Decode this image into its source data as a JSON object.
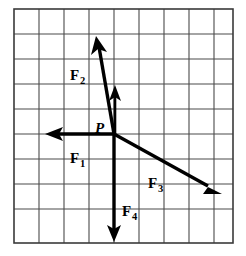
{
  "figure": {
    "background_color": "#ffffff",
    "grid": {
      "columns": 8,
      "rows": 9,
      "cell_size_px": 25,
      "left_px": 14,
      "top_px": 9,
      "line_color": "#4a4a4a",
      "border_color": "#3a3a3a"
    },
    "origin": {
      "label": "P",
      "grid_col": 4,
      "grid_row": 5,
      "x_px": 114,
      "y_px": 134,
      "label_x_px": 95,
      "label_y_px": 133
    },
    "vectors": [
      {
        "name": "F1",
        "label_base": "F",
        "label_sub": "1",
        "direction": "left",
        "length_units": 2.7,
        "tip_x_px": 46,
        "tip_y_px": 134,
        "label_x_px": 70,
        "label_y_px": 163,
        "color": "#000000"
      },
      {
        "name": "F2",
        "label_base": "F",
        "label_sub": "2",
        "direction": "up-left",
        "length_units": 4.0,
        "tip_x_px": 96,
        "tip_y_px": 38,
        "label_x_px": 70,
        "label_y_px": 80,
        "color": "#000000"
      },
      {
        "name": "F3",
        "label_base": "F",
        "label_sub": "3",
        "direction": "down-right",
        "length_units": 4.5,
        "tip_x_px": 221,
        "tip_y_px": 194,
        "label_x_px": 148,
        "label_y_px": 188,
        "color": "#000000"
      },
      {
        "name": "F4",
        "label_base": "F",
        "label_sub": "4",
        "direction": "down",
        "length_units": 4.2,
        "tip_x_px": 114,
        "tip_y_px": 241,
        "label_x_px": 122,
        "label_y_px": 216,
        "color": "#000000"
      },
      {
        "name": "F5-unlabeled",
        "label_base": "",
        "label_sub": "",
        "direction": "up",
        "length_units": 1.9,
        "tip_x_px": 114,
        "tip_y_px": 86,
        "label_x_px": 0,
        "label_y_px": 0,
        "color": "#000000"
      }
    ]
  }
}
